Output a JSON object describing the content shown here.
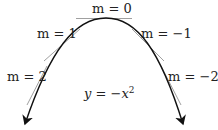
{
  "diagram": {
    "curve_label": "y = −x²",
    "curve_label_parts": {
      "lhs": "y",
      "eq": " = −",
      "var": "x",
      "exp": "2"
    },
    "tangents": [
      {
        "label": "m = 0",
        "slope": 0
      },
      {
        "label": "m = 1",
        "slope": 1
      },
      {
        "label": "m = −1",
        "slope": -1
      },
      {
        "label": "m = 2",
        "slope": 2
      },
      {
        "label": "m = −2",
        "slope": -2
      }
    ],
    "colors": {
      "curve": "#111111",
      "tangent": "#888888",
      "text": "#222222"
    }
  }
}
